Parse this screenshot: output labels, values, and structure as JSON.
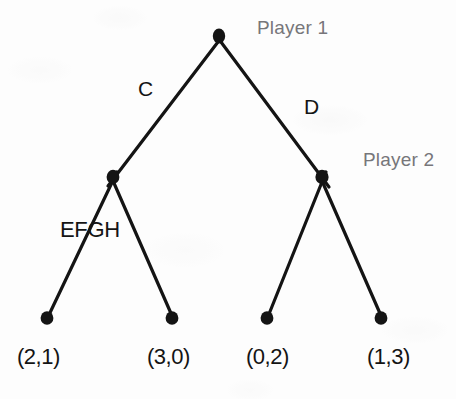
{
  "figure": {
    "type": "game-tree"
  },
  "labels": {
    "player1": "Player 1",
    "player2": "Player 2",
    "action_c": "C",
    "action_d": "D",
    "info_set": "EFGH"
  },
  "payoffs": [
    {
      "text": "(2,1)",
      "player1": 2,
      "player2": 1
    },
    {
      "text": "(3,0)",
      "player1": 3,
      "player2": 0
    },
    {
      "text": "(0,2)",
      "player1": 0,
      "player2": 2
    },
    {
      "text": "(1,3)",
      "player1": 1,
      "player2": 3
    }
  ],
  "colors": {
    "ink": "#141414",
    "player_label": "#77767a",
    "background": "#fdfdfd"
  },
  "geometry": {
    "root": {
      "x": 219,
      "y": 36
    },
    "decision_nodes": [
      {
        "x": 113,
        "y": 177
      },
      {
        "x": 322,
        "y": 177
      }
    ],
    "terminal_nodes": [
      {
        "x": 47,
        "y": 318
      },
      {
        "x": 172,
        "y": 318
      },
      {
        "x": 267,
        "y": 318
      },
      {
        "x": 381,
        "y": 318
      }
    ]
  }
}
